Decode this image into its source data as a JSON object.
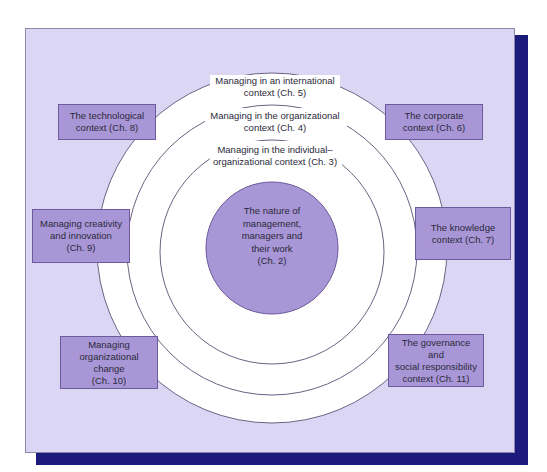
{
  "diagram": {
    "type": "concentric-context-diagram",
    "core": {
      "label": "The nature of management, managers and their work (Ch. 2)",
      "lines": [
        "The nature of",
        "management,",
        "managers and",
        "their work",
        "(Ch. 2)"
      ]
    },
    "rings": [
      {
        "level": 1,
        "lines": [
          "Managing in the individual–",
          "organizational context (Ch. 3)"
        ]
      },
      {
        "level": 2,
        "lines": [
          "Managing in the organizational",
          "context (Ch. 4)"
        ]
      },
      {
        "level": 3,
        "lines": [
          "Managing in an international",
          "context (Ch. 5)"
        ]
      }
    ],
    "outer_boxes": [
      {
        "id": "technological",
        "lines": [
          "The technological",
          "context (Ch. 8)"
        ]
      },
      {
        "id": "corporate",
        "lines": [
          "The corporate",
          "context (Ch. 6)"
        ]
      },
      {
        "id": "creativity",
        "lines": [
          "Managing creativity",
          "and innovation",
          "(Ch. 9)"
        ]
      },
      {
        "id": "knowledge",
        "lines": [
          "The knowledge",
          "context (Ch. 7)"
        ]
      },
      {
        "id": "change",
        "lines": [
          "Managing",
          "organizational change",
          "(Ch. 10)"
        ]
      },
      {
        "id": "governance",
        "lines": [
          "The governance and",
          "social responsibility",
          "context (Ch. 11)"
        ]
      }
    ],
    "colors": {
      "panel_fill": "#dcd6f5",
      "shadow": "#1c1a7a",
      "box_fill": "#a996d6",
      "core_fill": "#a996d6",
      "ring_fill": "#ffffff",
      "ring_stroke": "#6b6385"
    }
  }
}
